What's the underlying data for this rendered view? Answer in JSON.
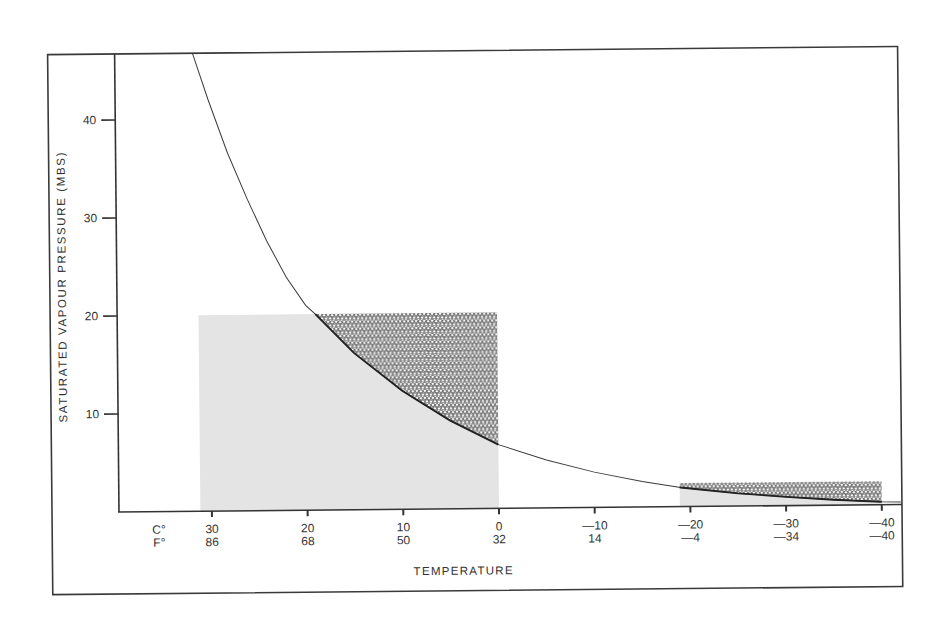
{
  "chart_data": {
    "type": "line",
    "title": "",
    "xlabel": "TEMPERATURE",
    "ylabel": "SATURATED VAPOUR PRESSURE (MBS)",
    "x_unit_labels": {
      "celsius": "C°",
      "fahrenheit": "F°"
    },
    "x_ticks_c": [
      30,
      20,
      10,
      0,
      -10,
      -20,
      -30,
      -40
    ],
    "x_tick_labels_c": [
      "30",
      "20",
      "10",
      "0",
      "—10",
      "—20",
      "—30",
      "—40"
    ],
    "x_tick_labels_f": [
      "86",
      "68",
      "50",
      "32",
      "14",
      "—4",
      "—34",
      "—40"
    ],
    "y_ticks": [
      10,
      20,
      30,
      40
    ],
    "y_tick_labels": [
      "10",
      "20",
      "30",
      "40"
    ],
    "xlim": [
      33,
      -42
    ],
    "ylim": [
      0,
      47
    ],
    "grid": false,
    "legend": null,
    "series": [
      {
        "name": "saturated vapour pressure curve",
        "x": [
          31.6,
          30,
          28,
          26,
          24,
          22,
          20,
          19,
          15,
          10,
          5,
          0,
          -5,
          -10,
          -15,
          -19,
          -25,
          -30,
          -35,
          -40,
          -42
        ],
        "y": [
          46.8,
          42,
          36.5,
          31.8,
          27.5,
          23.8,
          20.9,
          20,
          16,
          12.1,
          9,
          6.5,
          4.9,
          3.6,
          2.6,
          1.95,
          1.3,
          0.9,
          0.55,
          0.3,
          0.25
        ]
      }
    ],
    "shaded_regions": [
      {
        "name": "warm-region",
        "x_range": [
          31.2,
          0
        ],
        "y_top": 20,
        "fill_below_curve": "#e4e4e4",
        "stipple_above_curve": true
      },
      {
        "name": "cold-region",
        "x_range": [
          -18.9,
          -40
        ],
        "y_top": 2.4,
        "fill_below_curve": "#e4e4e4",
        "stipple_above_curve": true
      }
    ],
    "colors": {
      "line": "#3a3a3a",
      "axis": "#333333",
      "shade": "#e4e4e4",
      "stipple": "#2a2a2a"
    }
  }
}
